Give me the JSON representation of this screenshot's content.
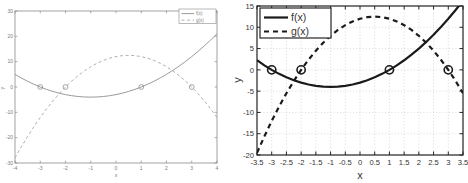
{
  "figure": {
    "background": "#ffffff"
  },
  "chart_data": [
    {
      "id": "left",
      "type": "line",
      "title": "",
      "xlabel": "x",
      "ylabel": "y",
      "xlim": [
        -4,
        4
      ],
      "ylim": [
        -30,
        30
      ],
      "x_ticks": [
        -4,
        -3,
        -2,
        -1,
        0,
        1,
        2,
        3,
        4
      ],
      "x_tick_labels": [
        "-4",
        "-3",
        "-2",
        "-1",
        "0",
        "1",
        "2",
        "3",
        "4"
      ],
      "y_ticks": [
        -30,
        -20,
        -10,
        0,
        10,
        20,
        30
      ],
      "y_tick_labels": [
        "-30",
        "-20",
        "-10",
        "0",
        "10",
        "20",
        "30"
      ],
      "grid": false,
      "axis_color": "#8a8a8a",
      "text_color": "#7d7d7d",
      "legend": {
        "position": "top-right",
        "entries": [
          {
            "label": "f(x)",
            "style": "solid"
          },
          {
            "label": "g(x)",
            "style": "dashed"
          }
        ]
      },
      "x": [
        -4,
        -3.75,
        -3.5,
        -3.25,
        -3,
        -2.75,
        -2.5,
        -2.25,
        -2,
        -1.75,
        -1.5,
        -1.25,
        -1,
        -0.75,
        -0.5,
        -0.25,
        0,
        0.25,
        0.5,
        0.75,
        1,
        1.25,
        1.5,
        1.75,
        2,
        2.25,
        2.5,
        2.75,
        3,
        3.25,
        3.5,
        3.75,
        4
      ],
      "series": [
        {
          "name": "f(x)",
          "style": "solid",
          "color": "#8f8f8f",
          "y": [
            5,
            3.56,
            2.25,
            1.06,
            0,
            -0.94,
            -1.75,
            -2.44,
            -3,
            -3.44,
            -3.75,
            -3.94,
            -4,
            -3.94,
            -3.75,
            -3.44,
            -3,
            -2.44,
            -1.75,
            -0.94,
            0,
            1.06,
            2.25,
            3.56,
            5,
            6.56,
            8.25,
            10.06,
            12,
            14.06,
            16.25,
            18.56,
            21
          ]
        },
        {
          "name": "g(x)",
          "style": "dashed",
          "color": "#a6a6a6",
          "y": [
            -28,
            -23.63,
            -19.5,
            -15.63,
            -12,
            -8.63,
            -5.5,
            -2.63,
            0,
            2.38,
            4.5,
            6.38,
            8,
            9.38,
            10.5,
            11.38,
            12,
            12.38,
            12.5,
            12.38,
            12,
            11.38,
            10.5,
            9.38,
            8,
            6.38,
            4.5,
            2.38,
            0,
            -2.63,
            -5.5,
            -8.63,
            -12
          ]
        }
      ],
      "root_markers": {
        "shape": "open-circle",
        "color": "#8f8f8f",
        "points": [
          {
            "x": -3,
            "y": 0
          },
          {
            "x": -2,
            "y": 0
          },
          {
            "x": 1,
            "y": 0
          },
          {
            "x": 3,
            "y": 0
          }
        ]
      }
    },
    {
      "id": "right",
      "type": "line",
      "title": "",
      "xlabel": "x",
      "ylabel": "y",
      "xlim": [
        -3.5,
        3.5
      ],
      "ylim": [
        -20,
        15
      ],
      "x_ticks": [
        -3.5,
        -3,
        -2.5,
        -2,
        -1.5,
        -1,
        -0.5,
        0,
        0.5,
        1,
        1.5,
        2,
        2.5,
        3,
        3.5
      ],
      "x_tick_labels": [
        "-3.5",
        "-3",
        "-2.5",
        "-2",
        "-1.5",
        "-1",
        "-0.5",
        "0",
        "0.5",
        "1",
        "1.5",
        "2",
        "2.5",
        "3",
        "3.5"
      ],
      "y_ticks": [
        -20,
        -15,
        -10,
        -5,
        0,
        5,
        10,
        15
      ],
      "y_tick_labels": [
        "-20",
        "-15",
        "-10",
        "-5",
        "0",
        "5",
        "10",
        "15"
      ],
      "grid": true,
      "grid_color": "#c9c9c9",
      "axis_color": "#262626",
      "text_color": "#333333",
      "legend": {
        "position": "top-left",
        "entries": [
          {
            "label": "f(x)",
            "style": "solid"
          },
          {
            "label": "g(x)",
            "style": "dashed"
          }
        ]
      },
      "x": [
        -3.5,
        -3.25,
        -3,
        -2.75,
        -2.5,
        -2.25,
        -2,
        -1.75,
        -1.5,
        -1.25,
        -1,
        -0.75,
        -0.5,
        -0.25,
        0,
        0.25,
        0.5,
        0.75,
        1,
        1.25,
        1.5,
        1.75,
        2,
        2.25,
        2.5,
        2.75,
        3,
        3.25,
        3.5
      ],
      "series": [
        {
          "name": "f(x)",
          "style": "solid",
          "color": "#1a1a1a",
          "y": [
            2.25,
            1.06,
            0,
            -0.94,
            -1.75,
            -2.44,
            -3,
            -3.44,
            -3.75,
            -3.94,
            -4,
            -3.94,
            -3.75,
            -3.44,
            -3,
            -2.44,
            -1.75,
            -0.94,
            0,
            1.06,
            2.25,
            3.56,
            5,
            6.56,
            8.25,
            10.06,
            12,
            14.06,
            16.25
          ]
        },
        {
          "name": "g(x)",
          "style": "dashed",
          "color": "#1a1a1a",
          "y": [
            -19.5,
            -15.63,
            -12,
            -8.63,
            -5.5,
            -2.63,
            0,
            2.38,
            4.5,
            6.38,
            8,
            9.38,
            10.5,
            11.38,
            12,
            12.38,
            12.5,
            12.38,
            12,
            11.38,
            10.5,
            9.38,
            8,
            6.38,
            4.5,
            2.38,
            0,
            -2.63,
            -5.5
          ]
        }
      ],
      "root_markers": {
        "shape": "open-circle",
        "color": "#1a1a1a",
        "points": [
          {
            "x": -3,
            "y": 0
          },
          {
            "x": -2,
            "y": 0
          },
          {
            "x": 1,
            "y": 0
          },
          {
            "x": 3,
            "y": 0
          }
        ]
      }
    }
  ]
}
